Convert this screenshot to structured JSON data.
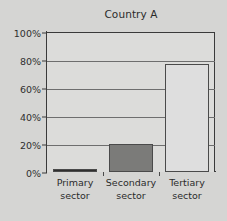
{
  "chart_data": {
    "type": "bar",
    "title": "Country A",
    "xlabel": "",
    "ylabel": "",
    "ylim": [
      0,
      100
    ],
    "grid": true,
    "legend": "none",
    "categories": [
      "Primary sector",
      "Secondary sector",
      "Tertiary sector"
    ],
    "category_lines": [
      [
        "Primary",
        "sector"
      ],
      [
        "Secondary",
        "sector"
      ],
      [
        "Tertiary",
        "sector"
      ]
    ],
    "values": [
      2,
      20,
      77
    ],
    "value_labels": [
      "2%",
      "20%",
      "77%"
    ],
    "y_ticks": [
      0,
      20,
      40,
      60,
      80,
      100
    ],
    "y_tick_labels": [
      "0%",
      "20%",
      "40%",
      "60%",
      "80%",
      "100%"
    ],
    "bar_colors": [
      "#2e2e2e",
      "#7b7b79",
      "#dedede"
    ],
    "bar_border_color": "#4a4a4a",
    "axis_color": "#3a3a3a",
    "grid_color": "#6e6e6e",
    "plot_background": "#dcdcda",
    "page_background": "#d5d5d3",
    "text_color": "#2b2b2b"
  }
}
